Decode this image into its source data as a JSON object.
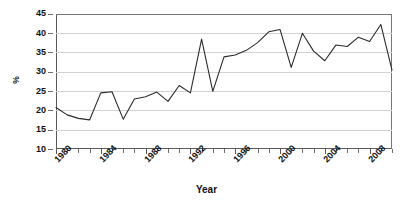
{
  "chart_data": {
    "type": "line",
    "title": "",
    "subtitle": "",
    "xlabel": "Year",
    "ylabel": "%",
    "xlim": [
      1980,
      2010
    ],
    "ylim": [
      10,
      45
    ],
    "ytick_values": [
      10,
      15,
      20,
      25,
      30,
      35,
      40,
      45
    ],
    "ytick_labels": [
      "10",
      "15",
      "20",
      "25",
      "30",
      "35",
      "40",
      "45"
    ],
    "xtick_values": [
      1980,
      1984,
      1988,
      1992,
      1996,
      2000,
      2004,
      2008
    ],
    "xtick_labels": [
      "1980",
      "1984",
      "1988",
      "1992",
      "1996",
      "2000",
      "2004",
      "2008"
    ],
    "xtick_minor_step": 1,
    "grid": "horizontal",
    "legend": "none",
    "line_color": "#2b2b2b",
    "line_width": 1.1,
    "markers": "none",
    "x": [
      1980,
      1981,
      1982,
      1983,
      1984,
      1985,
      1986,
      1987,
      1988,
      1989,
      1990,
      1991,
      1992,
      1993,
      1994,
      1995,
      1996,
      1997,
      1998,
      1999,
      2000,
      2001,
      2002,
      2003,
      2004,
      2005,
      2006,
      2007,
      2008,
      2009,
      2010
    ],
    "values": [
      20.8,
      18.9,
      18.0,
      17.6,
      24.6,
      24.9,
      17.8,
      23.0,
      23.6,
      24.8,
      22.4,
      26.5,
      24.6,
      38.5,
      25.0,
      33.9,
      34.4,
      35.6,
      37.6,
      40.4,
      41.0,
      31.2,
      40.0,
      35.4,
      32.9,
      37.0,
      36.6,
      39.0,
      37.9,
      42.3,
      30.5
    ],
    "series": [
      {
        "name": "%",
        "values": [
          20.8,
          18.9,
          18.0,
          17.6,
          24.6,
          24.9,
          17.8,
          23.0,
          23.6,
          24.8,
          22.4,
          26.5,
          24.6,
          38.5,
          25.0,
          33.9,
          34.4,
          35.6,
          37.6,
          40.4,
          41.0,
          31.2,
          40.0,
          35.4,
          32.9,
          37.0,
          36.6,
          39.0,
          37.9,
          42.3,
          30.5
        ]
      }
    ]
  },
  "axis": {
    "y_title": "%",
    "x_title": "Year"
  }
}
